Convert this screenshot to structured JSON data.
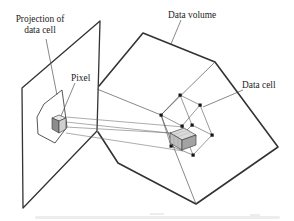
{
  "figure": {
    "type": "textbook-diagram",
    "topic": "Pixel on image plane projected through a data volume onto a data cell",
    "labels": {
      "projection_line1": "Projection of",
      "projection_line2": "data cell",
      "pixel": "Pixel",
      "data_volume": "Data volume",
      "data_cell": "Data cell"
    },
    "data_cell": {
      "corner_dot_count": 8
    },
    "ray_count": 4,
    "colors": {
      "background": "#ffffff",
      "ink": "#333333",
      "thin_line": "#555555",
      "ray_line": "#666666",
      "corner_dot": "#151515",
      "subcell_top": "#dadada",
      "subcell_left": "#bfbfbf",
      "subcell_right": "#a3a3a3",
      "pixel_top": "#e8e8e8",
      "pixel_left": "#8d8d8d",
      "pixel_right": "#cfcfcf"
    }
  }
}
